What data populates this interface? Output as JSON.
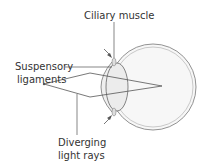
{
  "diagram": {
    "labels": {
      "ciliary_muscle": "Ciliary muscle",
      "suspensory_line1": "Suspensory",
      "suspensory_line2": "ligaments",
      "diverging_line1": "Diverging",
      "diverging_line2": "light rays"
    },
    "colors": {
      "stroke": "#555555",
      "eye_fill": "#f6f6f6",
      "lens_fill": "#eeeeee"
    }
  }
}
